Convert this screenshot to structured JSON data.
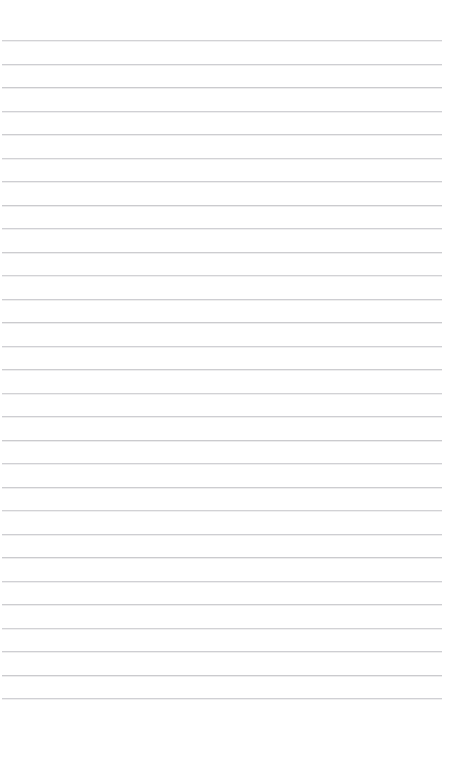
{
  "page": {
    "kind": "lined-notebook-paper",
    "width": 449,
    "height": 781,
    "background_color": "#ffffff",
    "content_text": ""
  },
  "ruling": {
    "line_color": "#c9c9cd",
    "line_thickness": 1,
    "line_spacing": 23.5,
    "first_line_y": 40,
    "line_start_x": 2,
    "line_end_x": 442,
    "line_count": 29,
    "line_y_positions": [
      40,
      63.5,
      87,
      110.5,
      134,
      157.5,
      181,
      204.5,
      228,
      251.5,
      275,
      298.5,
      322,
      345.5,
      369,
      392.5,
      416,
      439.5,
      463,
      486.5,
      510,
      533.5,
      557,
      580.5,
      604,
      627.5,
      651,
      674.5,
      698
    ]
  },
  "margins": {
    "top_margin_height": 40,
    "bottom_margin_height": 83,
    "left_margin_width": 2,
    "right_margin_width": 7
  }
}
